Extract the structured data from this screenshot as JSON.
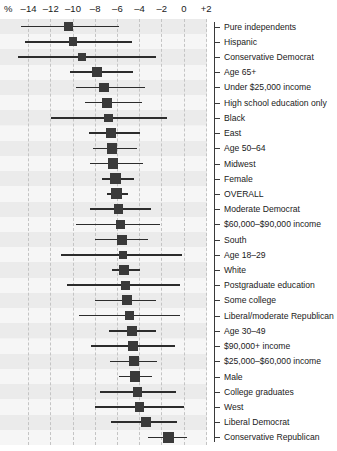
{
  "chart_data": {
    "type": "scatter",
    "subtype": "forest-plot",
    "title": "",
    "xlabel": "%",
    "ylabel": "",
    "xlim": [
      -15.5,
      3.0
    ],
    "xticks": [
      -14,
      -12,
      -10,
      -8,
      -6,
      -4,
      -2,
      0,
      2
    ],
    "xticklabels": [
      "–14",
      "–12",
      "–10",
      "–8",
      "–6",
      "–4",
      "–2",
      "0",
      "+2"
    ],
    "axis_unit": "%",
    "grid": true,
    "grid_style": "dashed-vertical",
    "legend": "none",
    "point_marker": "square",
    "error_bar_style": "horizontal-line",
    "categories": [
      "Pure independents",
      "Hispanic",
      "Conservative Democrat",
      "Age 65+",
      "Under $25,000 income",
      "High school education only",
      "Black",
      "East",
      "Age 50–64",
      "Midwest",
      "Female",
      "OVERALL",
      "Moderate Democrat",
      "$60,000–$90,000 income",
      "South",
      "Age 18–29",
      "White",
      "Postgraduate education",
      "Some college",
      "Liberal/moderate Republican",
      "Age 30–49",
      "$90,000+ income",
      "$25,000–$60,000 income",
      "Male",
      "College graduates",
      "West",
      "Liberal Democrat",
      "Conservative Republican"
    ],
    "values": [
      -10.4,
      -10.0,
      -9.2,
      -7.8,
      -7.2,
      -6.9,
      -6.8,
      -6.6,
      -6.5,
      -6.4,
      -6.2,
      -6.1,
      -5.9,
      -5.7,
      -5.6,
      -5.5,
      -5.4,
      -5.3,
      -5.1,
      -4.9,
      -4.7,
      -4.6,
      -4.5,
      -4.4,
      -4.2,
      -4.0,
      -3.4,
      -1.4
    ],
    "ci_low": [
      -14.7,
      -14.3,
      -15.0,
      -10.3,
      -9.7,
      -8.9,
      -12.0,
      -8.6,
      -8.2,
      -8.5,
      -7.4,
      -6.9,
      -8.5,
      -9.7,
      -8.0,
      -11.1,
      -6.5,
      -10.5,
      -8.0,
      -9.5,
      -6.8,
      -8.4,
      -6.7,
      -5.9,
      -7.6,
      -8.0,
      -6.6,
      -3.2
    ],
    "ci_high": [
      -5.9,
      -4.7,
      -2.5,
      -4.6,
      -3.5,
      -3.8,
      -1.5,
      -4.0,
      -4.2,
      -3.7,
      -4.5,
      -5.0,
      -3.0,
      -2.2,
      -3.2,
      -0.2,
      -4.0,
      -0.4,
      -2.5,
      -0.4,
      -2.5,
      -0.8,
      -2.4,
      -2.9,
      -0.7,
      0.0,
      -0.6,
      0.3
    ],
    "colors": {
      "marker": "#3a3a3a",
      "whisker": "#2c2c2c",
      "grid": "#c4c4c4",
      "band_odd": "#ebebeb",
      "band_even": "#f6f6f6",
      "plot_background": "#f2f2f2",
      "text": "#1a1a1a"
    }
  }
}
